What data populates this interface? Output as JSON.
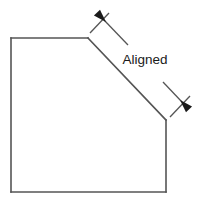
{
  "figure": {
    "background_color": "#ffffff",
    "width": 199,
    "height": 206
  },
  "style": {
    "outline_color": "#555555",
    "outline_width": 1.6,
    "dimension_color": "#555555",
    "dimension_width": 1.3,
    "arrow_color": "#1a1a1a",
    "label_color": "#1a1a1a",
    "label_font_size": 13.5,
    "fill_color": "#ffffff"
  },
  "part": {
    "name": "chamfered-square",
    "vertices": [
      {
        "name": "top-left",
        "x": 11,
        "y": 38
      },
      {
        "name": "chamfer-top",
        "x": 88,
        "y": 38
      },
      {
        "name": "chamfer-bottom",
        "x": 166,
        "y": 120
      },
      {
        "name": "bottom-right",
        "x": 166,
        "y": 192
      },
      {
        "name": "bottom-left",
        "x": 11,
        "y": 192
      }
    ],
    "edges": [
      {
        "name": "top-edge",
        "from": "top-left",
        "to": "chamfer-top"
      },
      {
        "name": "chamfer-edge",
        "from": "chamfer-top",
        "to": "chamfer-bottom"
      },
      {
        "name": "right-edge",
        "from": "chamfer-bottom",
        "to": "bottom-right"
      },
      {
        "name": "bottom-edge",
        "from": "bottom-right",
        "to": "bottom-left"
      },
      {
        "name": "left-edge",
        "from": "bottom-left",
        "to": "top-left"
      }
    ]
  },
  "dimension": {
    "type": "aligned",
    "label": "Aligned",
    "measured_edge": "chamfer-edge",
    "extension_lines": [
      {
        "name": "extension-line-start",
        "x1": 90,
        "y1": 33,
        "x2": 109,
        "y2": 13
      },
      {
        "name": "extension-line-end",
        "x1": 170,
        "y1": 117,
        "x2": 190,
        "y2": 96
      }
    ],
    "dimension_line": {
      "name": "dimension-line",
      "x1": 104,
      "y1": 20,
      "x2": 182,
      "y2": 102,
      "gap_start": {
        "x": 128,
        "y": 45
      },
      "gap_end": {
        "x": 163,
        "y": 82
      }
    },
    "arrows": [
      {
        "name": "arrow-start",
        "tip_x": 106,
        "tip_y": 22,
        "angle_deg": 226
      },
      {
        "name": "arrow-end",
        "tip_x": 180,
        "tip_y": 100,
        "angle_deg": 46
      }
    ],
    "label_position": {
      "x": 145,
      "y": 64
    }
  }
}
